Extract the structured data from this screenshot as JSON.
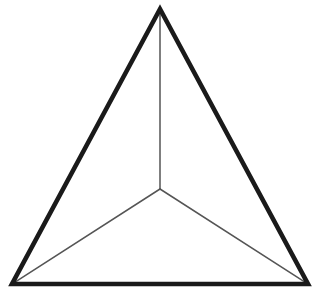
{
  "figure": {
    "name": "tetrahedron-wireframe",
    "background_color": "#ffffff",
    "canvas": {
      "width": 320,
      "height": 291
    },
    "outer_stroke_color": "#1a1a1a",
    "outer_stroke_width": 4.6,
    "inner_stroke_color": "#555555",
    "inner_stroke_width": 1.5,
    "face_color": "#ffffff",
    "vertices": {
      "apex": {
        "label": "apex",
        "x": 160,
        "y": 9
      },
      "bottom_left": {
        "label": "bottom-left",
        "x": 12,
        "y": 284
      },
      "bottom_right": {
        "label": "bottom-right",
        "x": 308,
        "y": 284
      },
      "center": {
        "label": "center",
        "x": 160,
        "y": 189
      }
    },
    "outer_edges": [
      {
        "name": "edge-apex-to-bottom-left",
        "x1": 160,
        "y1": 9,
        "x2": 12,
        "y2": 284
      },
      {
        "name": "edge-apex-to-bottom-right",
        "x1": 160,
        "y1": 9,
        "x2": 308,
        "y2": 284
      },
      {
        "name": "edge-bottom-left-to-bottom-right",
        "x1": 12,
        "y1": 284,
        "x2": 308,
        "y2": 284
      }
    ],
    "inner_edges": [
      {
        "name": "edge-center-to-apex",
        "x1": 160,
        "y1": 189,
        "x2": 160,
        "y2": 9
      },
      {
        "name": "edge-center-to-bottom-left",
        "x1": 160,
        "y1": 189,
        "x2": 12,
        "y2": 284
      },
      {
        "name": "edge-center-to-bottom-right",
        "x1": 160,
        "y1": 189,
        "x2": 308,
        "y2": 284
      }
    ],
    "outline_points": "160,9 308,284 12,284"
  },
  "chart_data": {
    "type": "diagram",
    "shape": "tetrahedron",
    "projection": "2d-wireframe",
    "vertex_count": 4,
    "edge_count": 6,
    "visible_edge_count": 6,
    "outer_triangle_vertices": [
      [
        160,
        9
      ],
      [
        308,
        284
      ],
      [
        12,
        284
      ]
    ],
    "interior_vertex": [
      160,
      189
    ],
    "labels": [],
    "legend": [],
    "grid": false
  }
}
